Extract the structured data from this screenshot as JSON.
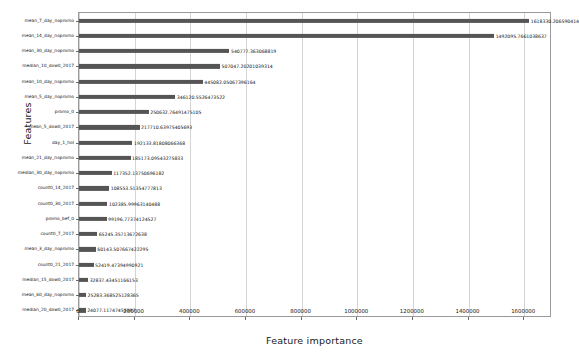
{
  "chart_data": {
    "type": "bar",
    "orientation": "horizontal",
    "title": "",
    "xlabel": "Feature importance",
    "ylabel": "Features",
    "xlim": [
      0,
      1700000
    ],
    "xticks": [
      0,
      200000,
      400000,
      600000,
      800000,
      1000000,
      1200000,
      1400000,
      1600000
    ],
    "xticklabels": [
      "0",
      "200000",
      "400000",
      "600000",
      "800000",
      "1000000",
      "1200000",
      "1400000",
      "1600000"
    ],
    "grid": true,
    "legend": false,
    "bar_color": "#555555",
    "categories": [
      "mean_7_day_nopromo",
      "mean_14_day_nopromo",
      "mean_30_day_nopromo",
      "median_10_dow0_2017",
      "mean_10_day_nopromo",
      "mean_5_day_nopromo",
      "promo_0",
      "mean_5_dow0_2017",
      "day_1_hol",
      "mean_21_day_nopromo",
      "median_30_day_nopromo",
      "count0_14_2017",
      "count0_30_2017",
      "promo_bef_0",
      "count0_7_2017",
      "mean_3_day_nopromo",
      "count0_21_2017",
      "median_15_dow0_2017",
      "mean_60_day_nopromo",
      "median_20_dow0_2017"
    ],
    "values": [
      1618330.206590414,
      1492095.7661038637,
      540777.363068819,
      507047.20201039314,
      445082.05067396164,
      346120.5526473522,
      250632.76491475105,
      217710.63975405693,
      192133.81808066368,
      185173.09543275833,
      117352.13750696182,
      108553.51354777813,
      102385.99963140488,
      99196.77374124527,
      65245.35713672638,
      60143.507667422295,
      52419.47394990921,
      32837.43451166153,
      25283.368525128364,
      24077.11747455597
    ],
    "value_labels": [
      "1618330.206590414",
      "1492095.7661038637",
      "540777.363068819",
      "507047.20201039314",
      "445082.05067396164",
      "346120.5526473522",
      "250632.76491475105",
      "217710.63975405693",
      "192133.81808066368",
      "185173.09543275833",
      "117352.13750696182",
      "108553.51354777813",
      "102385.99963140488",
      "99196.77374124527",
      "65245.35713672638",
      "60143.507667422295",
      "52419.47394990921",
      "32837.43451166153",
      "25283.368525128365",
      "24077.11747455597"
    ]
  }
}
